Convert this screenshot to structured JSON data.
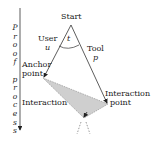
{
  "diagram": {
    "axis_label": "Proof process",
    "axis_letters": [
      "P",
      "r",
      "o",
      "o",
      "f",
      " ",
      "p",
      "r",
      "o",
      "c",
      "e",
      "s",
      "s"
    ],
    "nodes": {
      "start": "Start",
      "user": "User",
      "user_var": "u",
      "tool": "Tool",
      "tool_var": "p",
      "angle_var": "t",
      "anchor_line1": "Anchor",
      "anchor_line2": "point",
      "interaction_point_line1": "Interaction",
      "interaction_point_line2": "point",
      "interaction": "Interaction"
    },
    "colors": {
      "line": "#333333",
      "shaded_region": "#c8c8c8",
      "background": "#ffffff"
    }
  }
}
